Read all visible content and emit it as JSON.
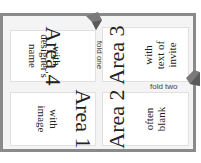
{
  "diagram": {
    "panels": [
      {
        "id": "area4",
        "title": "Area 4",
        "lines": [
          "with",
          "designer's",
          "name"
        ]
      },
      {
        "id": "area3",
        "title": "Area 3",
        "lines": [
          "with",
          "text of",
          "invite"
        ]
      },
      {
        "id": "area1",
        "title": "Area 1",
        "lines": [
          "with",
          "image"
        ]
      },
      {
        "id": "area2",
        "title": "Area 2",
        "lines": [
          "often",
          "blank"
        ]
      }
    ],
    "folds": {
      "one": "fold one",
      "two": "fold two"
    },
    "colors": {
      "frame": "#8a8a8a",
      "background": "#f4f4f4",
      "panel": "#ffffff",
      "arrow": "#7a7a7a"
    }
  }
}
